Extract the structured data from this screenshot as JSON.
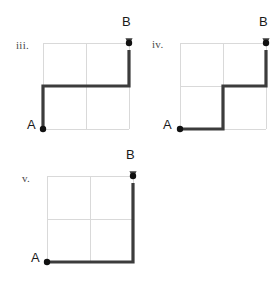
{
  "figure": {
    "background_color": "#ffffff",
    "grid_color": "#d9d9d9",
    "path_color": "#3c3c3c",
    "node_color": "#111111",
    "label_color": "#4a4a4a",
    "grid_size": 2,
    "cell_px": 43,
    "path_stroke_width": 3.2,
    "grid_stroke_width": 1,
    "node_radius": 3.2
  },
  "panels": [
    {
      "id": "panel-iii",
      "numeral": "iii.",
      "numeral_x": 16,
      "numeral_y": 39,
      "origin_x": 43,
      "origin_y": 43,
      "start_label": "A",
      "start_label_x": 27,
      "start_label_y": 117,
      "end_label": "B",
      "end_label_x": 122,
      "end_label_y": 14,
      "start_point": [
        0,
        0
      ],
      "end_point": [
        2,
        2
      ],
      "moves": [
        "U",
        "R",
        "R",
        "U"
      ],
      "path_points": [
        [
          0,
          0
        ],
        [
          0,
          1
        ],
        [
          1,
          1
        ],
        [
          2,
          1
        ],
        [
          2,
          2
        ]
      ],
      "description": "up, right, right, up"
    },
    {
      "id": "panel-iv",
      "numeral": "iv.",
      "numeral_x": 152,
      "numeral_y": 38,
      "origin_x": 180,
      "origin_y": 43,
      "start_label": "A",
      "start_label_x": 163,
      "start_label_y": 117,
      "end_label": "B",
      "end_label_x": 259,
      "end_label_y": 14,
      "start_point": [
        0,
        0
      ],
      "end_point": [
        2,
        2
      ],
      "moves": [
        "R",
        "U",
        "R",
        "U"
      ],
      "path_points": [
        [
          0,
          0
        ],
        [
          1,
          0
        ],
        [
          1,
          1
        ],
        [
          2,
          1
        ],
        [
          2,
          2
        ]
      ],
      "description": "right, up, right, up"
    },
    {
      "id": "panel-v",
      "numeral": "v.",
      "numeral_x": 22,
      "numeral_y": 172,
      "origin_x": 47,
      "origin_y": 176,
      "start_label": "A",
      "start_label_x": 31,
      "start_label_y": 250,
      "end_label": "B",
      "end_label_x": 126,
      "end_label_y": 147,
      "start_point": [
        0,
        0
      ],
      "end_point": [
        2,
        2
      ],
      "moves": [
        "R",
        "R",
        "U",
        "U"
      ],
      "path_points": [
        [
          0,
          0
        ],
        [
          1,
          0
        ],
        [
          2,
          0
        ],
        [
          2,
          1
        ],
        [
          2,
          2
        ]
      ],
      "description": "right, right, up, up"
    }
  ]
}
